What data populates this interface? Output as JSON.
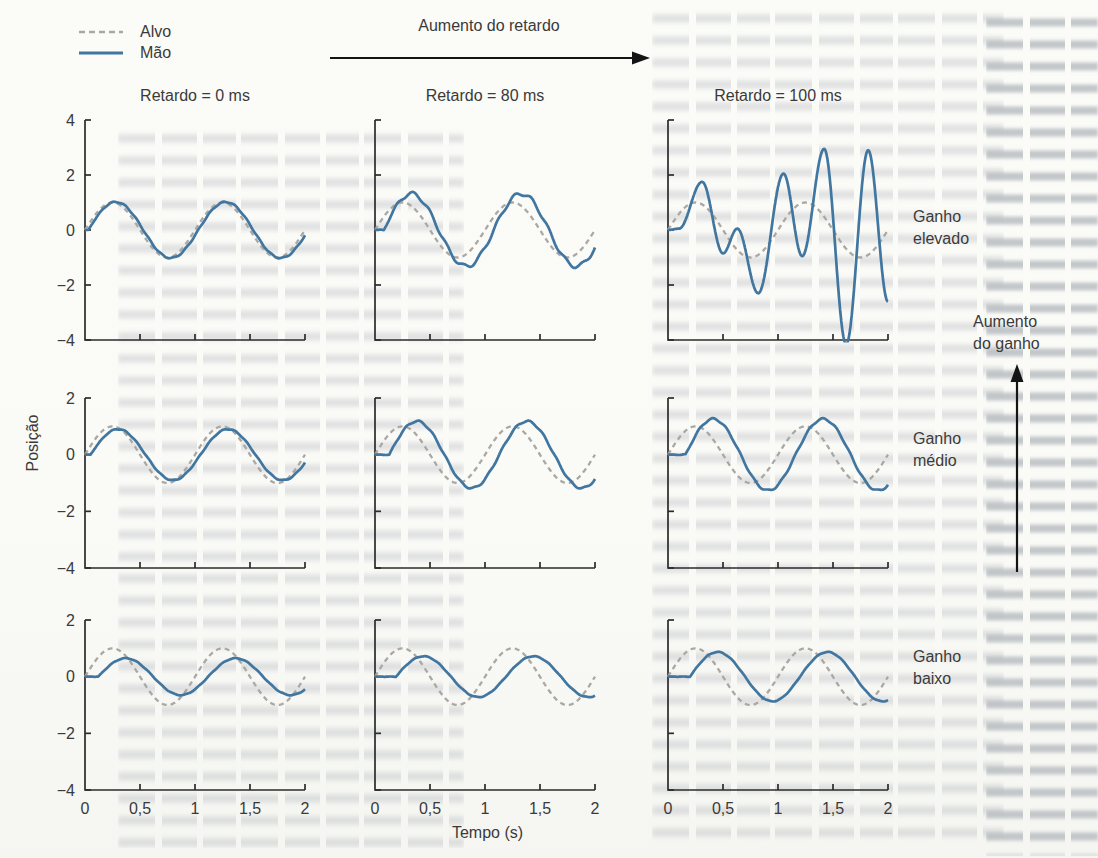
{
  "colors": {
    "hand": "#40769f",
    "target": "#aba8a4",
    "axis": "#2b2b2b",
    "text": "#3a3a3a",
    "paper": "#fafaf7"
  },
  "chart_data": {
    "type": "line",
    "xlabel": "Tempo (s)",
    "ylabel": "Posição",
    "x_range_s": [
      0,
      2
    ],
    "x_ticks": {
      "values": [
        0,
        0.5,
        1,
        1.5,
        2
      ],
      "labels": [
        "0",
        "0,5",
        "1",
        "1,5",
        "2"
      ]
    },
    "series_legend": [
      {
        "name": "Alvo",
        "style": "dashed",
        "color": "#aba8a4"
      },
      {
        "name": "Mão",
        "style": "solid",
        "color": "#40769f"
      }
    ],
    "annotations": {
      "top_arrow": "Aumento do retardo",
      "right_arrow_line1": "Aumento",
      "right_arrow_line2": "do ganho"
    },
    "target": {
      "model": "sine",
      "amplitude": 1,
      "frequency_hz": 1,
      "phase_s": 0
    },
    "columns": [
      {
        "header": "Retardo = 0 ms",
        "delay_ms": 0
      },
      {
        "header": "Retardo = 80 ms",
        "delay_ms": 80
      },
      {
        "header": "Retardo = 100 ms",
        "delay_ms": 100
      }
    ],
    "rows": [
      {
        "label_line1": "Ganho",
        "label_line2": "elevado",
        "y_range": [
          -4,
          4
        ],
        "y_ticks": {
          "values": [
            4,
            2,
            0,
            -2,
            -4
          ],
          "labels": [
            "4",
            "2",
            "0",
            "−2",
            "−4"
          ]
        }
      },
      {
        "label_line1": "Ganho",
        "label_line2": "médio",
        "y_range": [
          -4,
          2
        ],
        "y_ticks": {
          "values": [
            2,
            0,
            -2,
            -4
          ],
          "labels": [
            "2",
            "0",
            "−2",
            "−4"
          ]
        }
      },
      {
        "label_line1": "Ganho",
        "label_line2": "baixo",
        "y_range": [
          -4,
          2
        ],
        "y_ticks": {
          "values": [
            2,
            0,
            -2,
            -4
          ],
          "labels": [
            "2",
            "0",
            "−2",
            "−4"
          ]
        }
      }
    ],
    "panels": [
      {
        "row": 0,
        "col": 0,
        "hand": {
          "model": "sine",
          "amplitude": 1.02,
          "lag_s": 0.03,
          "ripple_amplitude": 0.02,
          "ripple_hz": 9
        }
      },
      {
        "row": 0,
        "col": 1,
        "hand": {
          "model": "sine",
          "amplitude": 1.32,
          "lag_s": 0.08,
          "ripple_amplitude": 0.07,
          "ripple_hz": 6.5
        }
      },
      {
        "row": 0,
        "col": 2,
        "hand": {
          "model": "points",
          "t": [
            0,
            0.1,
            0.31,
            0.5,
            0.63,
            0.82,
            1.05,
            1.22,
            1.42,
            1.62,
            1.82,
            2.0
          ],
          "y": [
            0,
            0.05,
            1.75,
            -0.85,
            0.05,
            -2.3,
            2.05,
            -0.95,
            2.95,
            -4.15,
            2.9,
            -2.6
          ]
        }
      },
      {
        "row": 1,
        "col": 0,
        "hand": {
          "model": "sine",
          "amplitude": 0.9,
          "lag_s": 0.05,
          "ripple_amplitude": 0.015,
          "ripple_hz": 9
        }
      },
      {
        "row": 1,
        "col": 1,
        "hand": {
          "model": "sine",
          "amplitude": 1.18,
          "lag_s": 0.13,
          "ripple_amplitude": 0.03,
          "ripple_hz": 8
        }
      },
      {
        "row": 1,
        "col": 2,
        "hand": {
          "model": "sine",
          "amplitude": 1.26,
          "lag_s": 0.16,
          "ripple_amplitude": 0.03,
          "ripple_hz": 8
        }
      },
      {
        "row": 2,
        "col": 0,
        "hand": {
          "model": "sine",
          "amplitude": 0.65,
          "lag_s": 0.12,
          "ripple_amplitude": 0.01,
          "ripple_hz": 9
        }
      },
      {
        "row": 2,
        "col": 1,
        "hand": {
          "model": "sine",
          "amplitude": 0.72,
          "lag_s": 0.19,
          "ripple_amplitude": 0.01,
          "ripple_hz": 9
        }
      },
      {
        "row": 2,
        "col": 2,
        "hand": {
          "model": "sine",
          "amplitude": 0.87,
          "lag_s": 0.2,
          "ripple_amplitude": 0.01,
          "ripple_hz": 9
        }
      }
    ]
  }
}
